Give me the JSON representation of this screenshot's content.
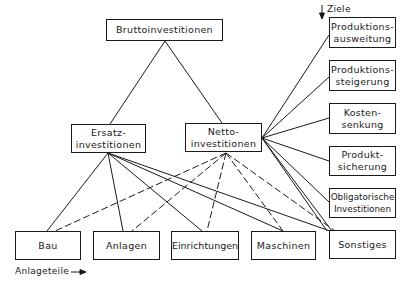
{
  "diagram": {
    "top": {
      "label": "Bruttoinvestitionen"
    },
    "middle": [
      {
        "label": "Ersatz-\ninvestitionen"
      },
      {
        "label": "Netto-\ninvestitionen"
      }
    ],
    "goals_label": "Ziele",
    "goals": [
      {
        "label": "Produktions-\nausweitung"
      },
      {
        "label": "Produktions-\nsteigerung"
      },
      {
        "label": "Kosten-\nsenkung"
      },
      {
        "label": "Produkt-\nsicherung"
      },
      {
        "label": "Obligatorische\nInvestitionen"
      }
    ],
    "parts_label": "Anlageteile",
    "parts": [
      {
        "label": "Bau"
      },
      {
        "label": "Anlagen"
      },
      {
        "label": "Einrichtungen"
      },
      {
        "label": "Maschinen"
      },
      {
        "label": "Sonstiges"
      }
    ],
    "colors": {
      "line": "#1a1a1a",
      "background": "#ffffff"
    }
  }
}
